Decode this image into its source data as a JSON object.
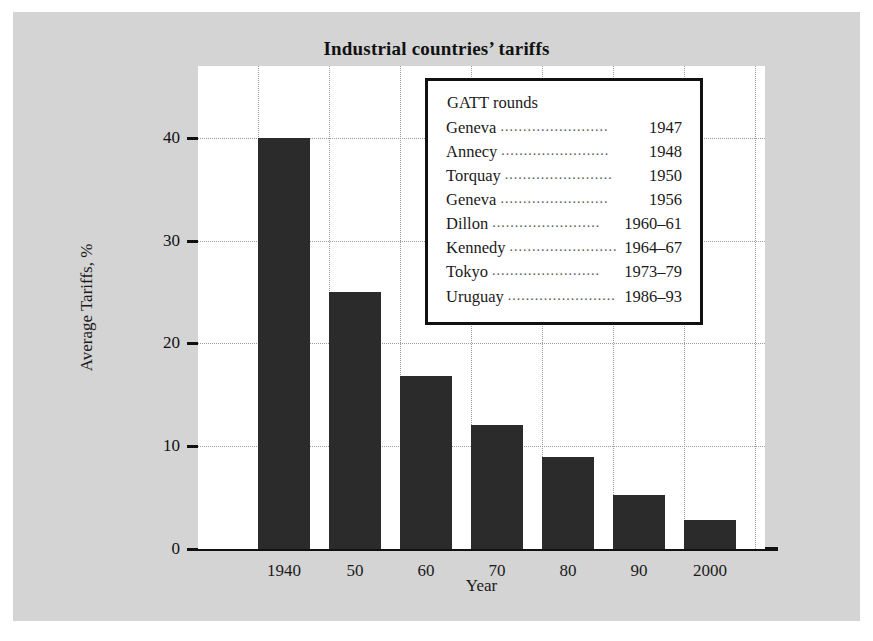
{
  "chart_data": {
    "type": "bar",
    "title": "Industrial countries’ tariffs",
    "xlabel": "Year",
    "ylabel": "Average Tariffs, %",
    "categories": [
      "1940",
      "50",
      "60",
      "70",
      "80",
      "90",
      "2000"
    ],
    "values": [
      40,
      25,
      16.8,
      12.1,
      9.0,
      5.3,
      2.8
    ],
    "ylim": [
      0,
      47
    ],
    "yticks": [
      0,
      10,
      20,
      30,
      40
    ],
    "ytick_labels": [
      "0",
      "10",
      "20",
      "30",
      "40"
    ],
    "grid": "dotted",
    "legend_position": "upper-right-inset",
    "bar_color": "#2b2b2b",
    "background_color": "#d4d4d4",
    "plot_background_color": "#ffffff",
    "annotations": {
      "legend_title": "GATT rounds",
      "rounds": [
        {
          "name": "Geneva",
          "years": "1947"
        },
        {
          "name": "Annecy",
          "years": "1948"
        },
        {
          "name": "Torquay",
          "years": "1950"
        },
        {
          "name": "Geneva",
          "years": "1956"
        },
        {
          "name": "Dillon",
          "years": "1960–61"
        },
        {
          "name": "Kennedy",
          "years": "1964–67"
        },
        {
          "name": "Tokyo",
          "years": "1973–79"
        },
        {
          "name": "Uruguay",
          "years": "1986–93"
        }
      ]
    }
  },
  "legend": {
    "title": "GATT rounds",
    "dots": "........................",
    "rows": [
      {
        "name": "Geneva",
        "year": "1947"
      },
      {
        "name": "Annecy",
        "year": "1948"
      },
      {
        "name": "Torquay",
        "year": "1950"
      },
      {
        "name": "Geneva",
        "year": "1956"
      },
      {
        "name": "Dillon",
        "year": "1960–61"
      },
      {
        "name": "Kennedy",
        "year": "1964–67"
      },
      {
        "name": "Tokyo",
        "year": "1973–79"
      },
      {
        "name": "Uruguay",
        "year": "1986–93"
      }
    ]
  }
}
